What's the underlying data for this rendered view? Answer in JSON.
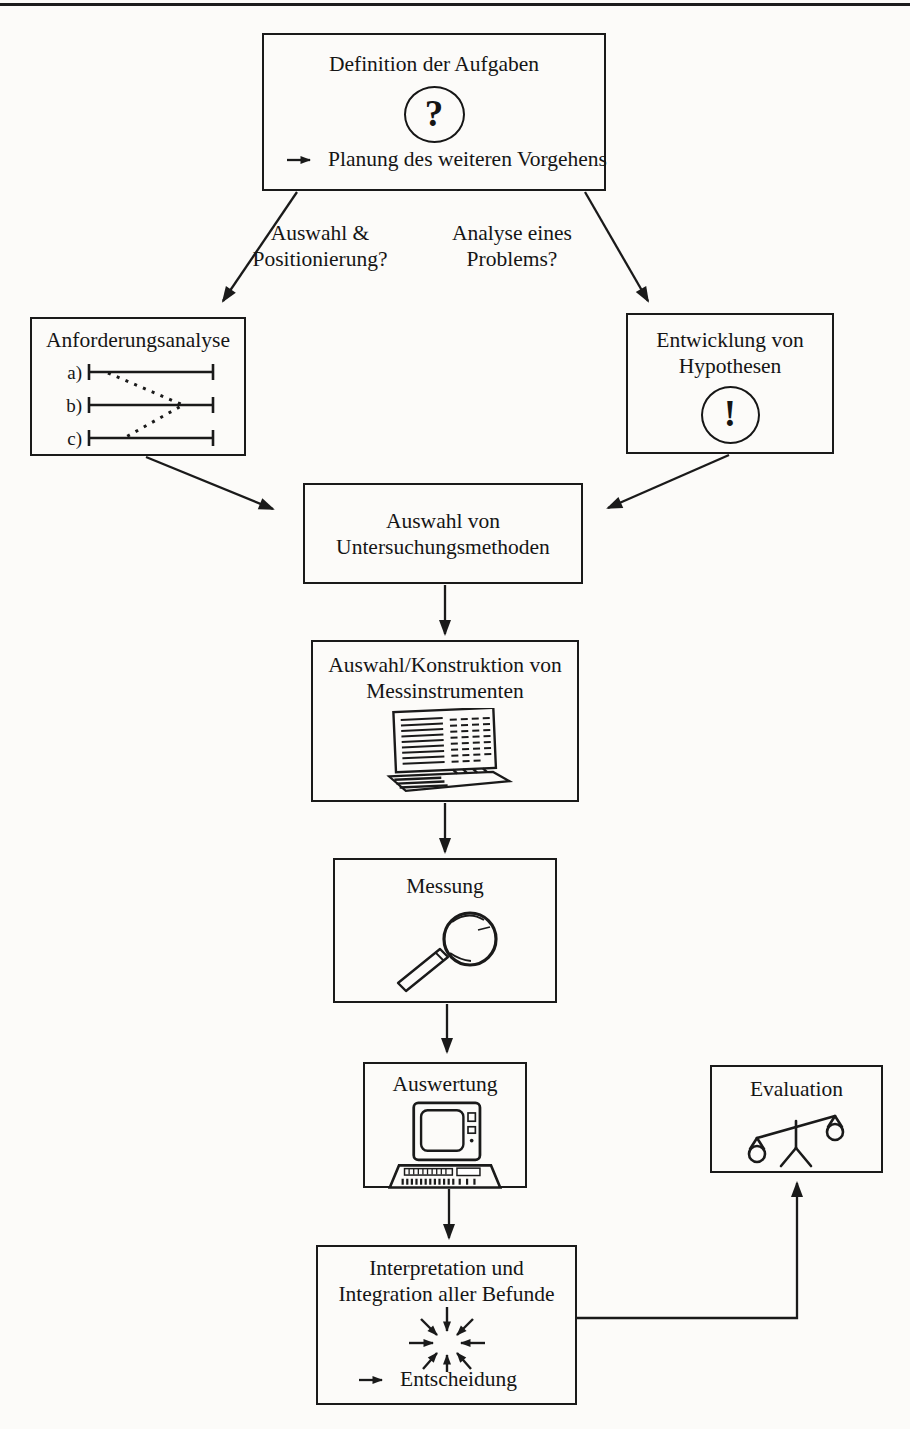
{
  "page": {
    "paper_color": "#fcfbf9",
    "ink_color": "#1a1a1a"
  },
  "symbols": {
    "question": "?",
    "exclamation": "!"
  },
  "branch_labels": {
    "left": {
      "line1": "Auswahl &",
      "line2": "Positionierung?"
    },
    "right": {
      "line1": "Analyse eines",
      "line2": "Problems?"
    }
  },
  "nodes": {
    "definition": {
      "title": "Definition der Aufgaben",
      "note": "Planung des weiteren Vorgehens"
    },
    "anforderungsanalyse": {
      "title": "Anforderungsanalyse",
      "scale_items": [
        "a)",
        "b)",
        "c)"
      ]
    },
    "hypothesen": {
      "title_line1": "Entwicklung von",
      "title_line2": "Hypothesen"
    },
    "untersuchungsmethoden": {
      "title_line1": "Auswahl von",
      "title_line2": "Untersuchungsmethoden"
    },
    "messinstrumente": {
      "title_line1": "Auswahl/Konstruktion von",
      "title_line2": "Messinstrumenten"
    },
    "messung": {
      "title": "Messung"
    },
    "auswertung": {
      "title": "Auswertung"
    },
    "evaluation": {
      "title": "Evaluation"
    },
    "interpretation": {
      "title_line1": "Interpretation und",
      "title_line2": "Integration aller Befunde",
      "note": "Entscheidung"
    }
  }
}
